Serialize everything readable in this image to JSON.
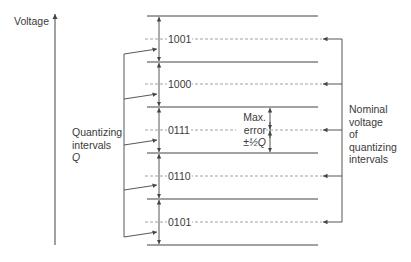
{
  "axis": {
    "label": "Voltage"
  },
  "levels": [
    {
      "code": "1001",
      "y": 39
    },
    {
      "code": "1000",
      "y": 84
    },
    {
      "code": "0111",
      "y": 130
    },
    {
      "code": "0110",
      "y": 176
    },
    {
      "code": "0101",
      "y": 222
    }
  ],
  "boundaries_y": [
    16,
    62,
    107,
    153,
    199,
    245
  ],
  "left_label": {
    "line1": "Quantizing",
    "line2": "intervals",
    "line3": "Q"
  },
  "right_label": {
    "line1": "Nominal",
    "line2": "voltage",
    "line3": "of",
    "line4": "quantizing",
    "line5": "intervals"
  },
  "max_error": {
    "line1": "Max.",
    "line2": "error",
    "line3": "±½Q"
  },
  "colors": {
    "line": "#444444",
    "dashed": "#8a8a8a"
  }
}
